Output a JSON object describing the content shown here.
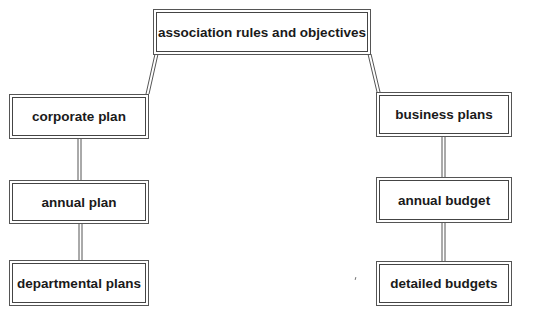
{
  "diagram": {
    "type": "hierarchy",
    "root": {
      "label": "association rules and objectives"
    },
    "left_branch": [
      {
        "label": "corporate plan"
      },
      {
        "label": "annual plan"
      },
      {
        "label": "departmental plans"
      }
    ],
    "right_branch": [
      {
        "label": "business plans"
      },
      {
        "label": "annual budget"
      },
      {
        "label": "detailed budgets"
      }
    ],
    "edges": [
      [
        "association rules and objectives",
        "corporate plan"
      ],
      [
        "corporate plan",
        "annual plan"
      ],
      [
        "annual plan",
        "departmental plans"
      ],
      [
        "association rules and objectives",
        "business plans"
      ],
      [
        "business plans",
        "annual budget"
      ],
      [
        "annual budget",
        "detailed budgets"
      ]
    ]
  }
}
